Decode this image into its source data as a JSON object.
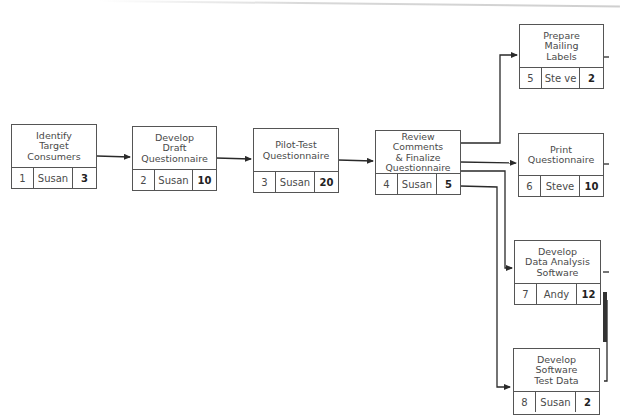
{
  "diagram": {
    "type": "network-diagram",
    "nodes": [
      {
        "id": "1",
        "title": "Identify\nTarget\nConsumers",
        "owner": "Susan",
        "duration": "3"
      },
      {
        "id": "2",
        "title": "Develop\nDraft\nQuestionnaire",
        "owner": "Susan",
        "duration": "10"
      },
      {
        "id": "3",
        "title": "Pilot-Test\nQuestionnaire",
        "owner": "Susan",
        "duration": "20"
      },
      {
        "id": "4",
        "title": "Review Comments\n& Finalize\nQuestionnaire",
        "owner": "Susan",
        "duration": "5"
      },
      {
        "id": "5",
        "title": "Prepare\nMailing\nLabels",
        "owner": "Ste ve",
        "duration": "2"
      },
      {
        "id": "6",
        "title": "Print\nQuestionnaire",
        "owner": "Steve",
        "duration": "10"
      },
      {
        "id": "7",
        "title": "Develop\nData Analysis\nSoftware",
        "owner": "Andy",
        "duration": "12"
      },
      {
        "id": "8",
        "title": "Develop\nSoftware\nTest Data",
        "owner": "Susan",
        "duration": "2"
      }
    ],
    "edges": [
      {
        "from": "1",
        "to": "2"
      },
      {
        "from": "2",
        "to": "3"
      },
      {
        "from": "3",
        "to": "4"
      },
      {
        "from": "4",
        "to": "5"
      },
      {
        "from": "4",
        "to": "6"
      },
      {
        "from": "4",
        "to": "7"
      },
      {
        "from": "4",
        "to": "8"
      }
    ]
  }
}
